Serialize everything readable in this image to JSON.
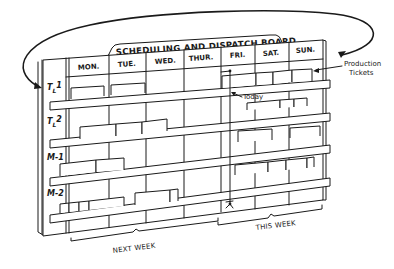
{
  "figure": {
    "title": "SCHEDULING AND DISPATCH BOARD",
    "days": [
      "MON.",
      "TUE.",
      "WED.",
      "THUR.",
      "FRI.",
      "SAT.",
      "SUN."
    ],
    "rows": [
      {
        "label_main": "T",
        "label_sub": "L",
        "label_num": "1"
      },
      {
        "label_main": "T",
        "label_sub": "L",
        "label_num": "2"
      },
      {
        "label_main": "M-1",
        "label_sub": "",
        "label_num": ""
      },
      {
        "label_main": "M-2",
        "label_sub": "",
        "label_num": ""
      }
    ],
    "annotations": {
      "production_tickets_line1": "Production",
      "production_tickets_line2": "Tickets",
      "today": "Today",
      "next_week": "NEXT WEEK",
      "this_week": "THIS WEEK"
    },
    "colors": {
      "ink": "#1a1a1a",
      "paper": "#ffffff"
    }
  }
}
